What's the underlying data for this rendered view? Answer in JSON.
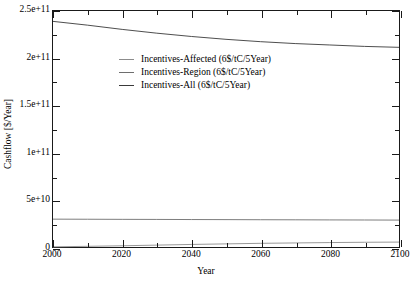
{
  "chart_data": {
    "type": "line",
    "title": "",
    "xlabel": "Year",
    "ylabel": "Cashflow [$/Year]",
    "xlim": [
      2000,
      2100
    ],
    "ylim": [
      0,
      250000000000
    ],
    "xticks": [
      2000,
      2020,
      2040,
      2060,
      2080,
      2100
    ],
    "xticklabels": [
      "2000",
      "2020",
      "2040",
      "2060",
      "2080",
      "2100"
    ],
    "xminorticks": [
      2010,
      2030,
      2050,
      2070,
      2090
    ],
    "yticks": [
      0,
      50000000000,
      100000000000,
      150000000000,
      200000000000,
      250000000000
    ],
    "yticklabels": [
      "0",
      "5e+10",
      "1e+11",
      "1.5e+11",
      "2e+11",
      "2.5e+11"
    ],
    "yminorticks": [
      25000000000,
      75000000000,
      125000000000,
      175000000000,
      225000000000
    ],
    "grid": false,
    "legend_position": "upper left",
    "x": [
      2000,
      2010,
      2020,
      2030,
      2040,
      2050,
      2060,
      2070,
      2080,
      2090,
      2100
    ],
    "series": [
      {
        "name": "Incentives-Affected (6$/tC/5Year)",
        "color": "#8c8c8c",
        "values": [
          200000000,
          700000000,
          1300000000,
          2000000000,
          2700000000,
          3300000000,
          3900000000,
          4300000000,
          4700000000,
          5000000000,
          5200000000
        ]
      },
      {
        "name": "Incentives-Region (6$/tC/5Year)",
        "color": "#6e6e6e",
        "values": [
          29500000000,
          29400000000,
          29300000000,
          29200000000,
          29100000000,
          29000000000,
          28900000000,
          28800000000,
          28700000000,
          28600000000,
          28500000000
        ]
      },
      {
        "name": "Incentives-All (6$/tC/5Year)",
        "color": "#3a3a3a",
        "values": [
          239000000000,
          235000000000,
          230500000000,
          226500000000,
          223000000000,
          220000000000,
          217500000000,
          215500000000,
          214000000000,
          212500000000,
          211500000000
        ]
      }
    ]
  }
}
